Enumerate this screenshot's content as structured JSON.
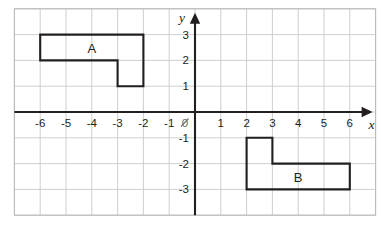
{
  "figure": {
    "title": "",
    "axis_labels": {
      "x": "x",
      "y": "y"
    },
    "origin_label": "0"
  },
  "chart_data": {
    "type": "scatter",
    "title": "",
    "xlabel": "x",
    "ylabel": "y",
    "grid": true,
    "legend_position": "none",
    "xlim": [
      -7,
      7
    ],
    "ylim": [
      -4,
      4
    ],
    "x_ticks": [
      -6,
      -5,
      -4,
      -3,
      -2,
      -1,
      1,
      2,
      3,
      4,
      5,
      6
    ],
    "y_ticks": [
      3,
      2,
      1,
      -1,
      -2,
      -3
    ],
    "x_tick_labels": [
      "-6",
      "-5",
      "-4",
      "-3",
      "-2",
      "-1",
      "1",
      "2",
      "3",
      "4",
      "5",
      "6"
    ],
    "y_tick_labels": [
      "3",
      "2",
      "1",
      "-1",
      "-2",
      "-3"
    ],
    "origin_tick_label": "0",
    "grid_x_range": [
      -7,
      7
    ],
    "grid_y_range": [
      -4,
      4
    ],
    "shapes": [
      {
        "label": "A",
        "type": "polygon",
        "label_position": [
          -4,
          2.5
        ],
        "vertices": [
          [
            -6,
            3
          ],
          [
            -2,
            3
          ],
          [
            -2,
            1
          ],
          [
            -3,
            1
          ],
          [
            -3,
            2
          ],
          [
            -6,
            2
          ]
        ]
      },
      {
        "label": "B",
        "type": "polygon",
        "label_position": [
          4,
          -2.5
        ],
        "vertices": [
          [
            2,
            -1
          ],
          [
            3,
            -1
          ],
          [
            3,
            -2
          ],
          [
            6,
            -2
          ],
          [
            6,
            -3
          ],
          [
            2,
            -3
          ]
        ]
      }
    ]
  },
  "colors": {
    "shape_stroke": "#231f20",
    "axis": "#231f20",
    "grid": "#c9c9c9",
    "background": "#ffffff"
  }
}
